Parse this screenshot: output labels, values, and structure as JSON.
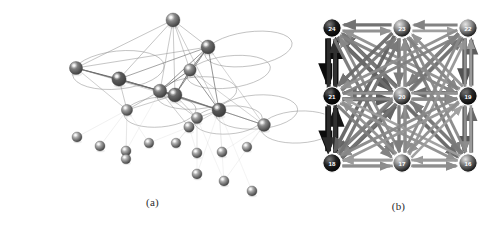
{
  "figure": {
    "panels": [
      {
        "id": "a",
        "caption": "(a)",
        "kind": "3d-force-directed-network",
        "description": "Three-dimensional layout of a network of shaded spheres joined by thin straight lines, with large thin elliptical rings (self-loops / community shells) drawn around several hub nodes."
      },
      {
        "id": "b",
        "caption": "(b)",
        "kind": "grid-directed-weighted-graph",
        "description": "Nine nodes arranged on a 3x3 grid, fully interconnected by weighted directed arrows of varying thickness and darkness."
      }
    ]
  },
  "chart_data": [
    {
      "type": "scatter",
      "id": "panel-a-network",
      "title": "(a)",
      "xlabel": "",
      "ylabel": "",
      "grid": false,
      "legend": "none",
      "xlim": [
        0,
        305
      ],
      "ylim": [
        0,
        200
      ],
      "nodes": [
        {
          "id": "n1",
          "x": 173,
          "y": 20,
          "r": 7.0,
          "shade": "#8a8a8a",
          "ring": false
        },
        {
          "id": "n2",
          "x": 208,
          "y": 47,
          "r": 7.0,
          "shade": "#6f6f6f",
          "ring": true,
          "rx": 44,
          "ry": 17,
          "rot": -8
        },
        {
          "id": "n3",
          "x": 76,
          "y": 68,
          "r": 6.6,
          "shade": "#7d7d7d",
          "ring": true,
          "rx": 46,
          "ry": 19,
          "rot": -6
        },
        {
          "id": "n4",
          "x": 190,
          "y": 70,
          "r": 6.2,
          "shade": "#8e8e8e",
          "ring": true,
          "rx": 42,
          "ry": 16,
          "rot": -7
        },
        {
          "id": "n5",
          "x": 119,
          "y": 79,
          "r": 7.2,
          "shade": "#5e5e5e",
          "ring": false
        },
        {
          "id": "n6",
          "x": 160,
          "y": 91,
          "r": 6.8,
          "shade": "#7a7a7a",
          "ring": true,
          "rx": 40,
          "ry": 16,
          "rot": -5
        },
        {
          "id": "n7",
          "x": 175,
          "y": 95,
          "r": 7.0,
          "shade": "#6b6b6b",
          "ring": false
        },
        {
          "id": "n8",
          "x": 219,
          "y": 110,
          "r": 7.0,
          "shade": "#5a5a5a",
          "ring": true,
          "rx": 41,
          "ry": 17,
          "rot": -4
        },
        {
          "id": "n9",
          "x": 127,
          "y": 110,
          "r": 5.6,
          "shade": "#9a9a9a",
          "ring": true,
          "rx": 36,
          "ry": 15,
          "rot": -5
        },
        {
          "id": "n10",
          "x": 197,
          "y": 118,
          "r": 5.6,
          "shade": "#9a9a9a",
          "ring": true,
          "rx": 34,
          "ry": 14,
          "rot": -4
        },
        {
          "id": "n11",
          "x": 264,
          "y": 125,
          "r": 6.4,
          "shade": "#8a8a8a",
          "ring": true,
          "rx": 38,
          "ry": 16,
          "rot": -3
        },
        {
          "id": "n12",
          "x": 189,
          "y": 127,
          "r": 5.2,
          "shade": "#a2a2a2",
          "ring": false
        },
        {
          "id": "n13",
          "x": 77,
          "y": 137,
          "r": 5.0,
          "shade": "#a8a8a8",
          "ring": false
        },
        {
          "id": "n14",
          "x": 100,
          "y": 146,
          "r": 5.0,
          "shade": "#a5a5a5",
          "ring": false
        },
        {
          "id": "n15",
          "x": 126,
          "y": 151,
          "r": 5.0,
          "shade": "#a5a5a5",
          "ring": false
        },
        {
          "id": "n16",
          "x": 149,
          "y": 143,
          "r": 4.8,
          "shade": "#ababab",
          "ring": false
        },
        {
          "id": "n17",
          "x": 176,
          "y": 143,
          "r": 4.8,
          "shade": "#ababab",
          "ring": false
        },
        {
          "id": "n18",
          "x": 126,
          "y": 159,
          "r": 4.8,
          "shade": "#adadad",
          "ring": false
        },
        {
          "id": "n19",
          "x": 197,
          "y": 153,
          "r": 5.0,
          "shade": "#a5a5a5",
          "ring": false
        },
        {
          "id": "n20",
          "x": 222,
          "y": 152,
          "r": 5.0,
          "shade": "#a5a5a5",
          "ring": false
        },
        {
          "id": "n21",
          "x": 247,
          "y": 147,
          "r": 4.8,
          "shade": "#adadad",
          "ring": false
        },
        {
          "id": "n22",
          "x": 197,
          "y": 174,
          "r": 5.0,
          "shade": "#a5a5a5",
          "ring": false
        },
        {
          "id": "n23",
          "x": 224,
          "y": 181,
          "r": 5.0,
          "shade": "#a5a5a5",
          "ring": false
        },
        {
          "id": "n24",
          "x": 252,
          "y": 191,
          "r": 5.0,
          "shade": "#a5a5a5",
          "ring": false
        }
      ],
      "edges": [
        {
          "s": "n1",
          "t": "n3",
          "w": 0.55
        },
        {
          "s": "n1",
          "t": "n2",
          "w": 0.55
        },
        {
          "s": "n1",
          "t": "n5",
          "w": 0.55
        },
        {
          "s": "n1",
          "t": "n6",
          "w": 0.5
        },
        {
          "s": "n1",
          "t": "n7",
          "w": 0.5
        },
        {
          "s": "n1",
          "t": "n4",
          "w": 0.5
        },
        {
          "s": "n1",
          "t": "n8",
          "w": 0.45
        },
        {
          "s": "n2",
          "t": "n3",
          "w": 0.55
        },
        {
          "s": "n2",
          "t": "n5",
          "w": 0.6
        },
        {
          "s": "n2",
          "t": "n7",
          "w": 0.75
        },
        {
          "s": "n2",
          "t": "n6",
          "w": 0.7
        },
        {
          "s": "n2",
          "t": "n4",
          "w": 0.8
        },
        {
          "s": "n2",
          "t": "n8",
          "w": 0.7
        },
        {
          "s": "n2",
          "t": "n11",
          "w": 0.4
        },
        {
          "s": "n3",
          "t": "n5",
          "w": 0.8
        },
        {
          "s": "n3",
          "t": "n6",
          "w": 0.6
        },
        {
          "s": "n3",
          "t": "n7",
          "w": 0.6
        },
        {
          "s": "n3",
          "t": "n9",
          "w": 0.45
        },
        {
          "s": "n3",
          "t": "n8",
          "w": 0.4
        },
        {
          "s": "n4",
          "t": "n7",
          "w": 0.8
        },
        {
          "s": "n4",
          "t": "n6",
          "w": 0.75
        },
        {
          "s": "n4",
          "t": "n8",
          "w": 0.7
        },
        {
          "s": "n4",
          "t": "n11",
          "w": 0.4
        },
        {
          "s": "n5",
          "t": "n6",
          "w": 0.75
        },
        {
          "s": "n5",
          "t": "n7",
          "w": 0.75
        },
        {
          "s": "n5",
          "t": "n9",
          "w": 0.5
        },
        {
          "s": "n5",
          "t": "n8",
          "w": 0.5
        },
        {
          "s": "n6",
          "t": "n7",
          "w": 0.9
        },
        {
          "s": "n6",
          "t": "n8",
          "w": 0.7
        },
        {
          "s": "n6",
          "t": "n9",
          "w": 0.55
        },
        {
          "s": "n6",
          "t": "n10",
          "w": 0.5
        },
        {
          "s": "n6",
          "t": "n12",
          "w": 0.45
        },
        {
          "s": "n7",
          "t": "n8",
          "w": 0.8
        },
        {
          "s": "n7",
          "t": "n10",
          "w": 0.5
        },
        {
          "s": "n7",
          "t": "n9",
          "w": 0.5
        },
        {
          "s": "n7",
          "t": "n11",
          "w": 0.45
        },
        {
          "s": "n8",
          "t": "n11",
          "w": 0.6
        },
        {
          "s": "n8",
          "t": "n10",
          "w": 0.5
        },
        {
          "s": "n8",
          "t": "n12",
          "w": 0.4
        },
        {
          "s": "n9",
          "t": "n13",
          "w": 0.22
        },
        {
          "s": "n9",
          "t": "n14",
          "w": 0.22
        },
        {
          "s": "n9",
          "t": "n15",
          "w": 0.22
        },
        {
          "s": "n9",
          "t": "n16",
          "w": 0.2
        },
        {
          "s": "n9",
          "t": "n18",
          "w": 0.2
        },
        {
          "s": "n10",
          "t": "n17",
          "w": 0.2
        },
        {
          "s": "n10",
          "t": "n19",
          "w": 0.2
        },
        {
          "s": "n10",
          "t": "n22",
          "w": 0.18
        },
        {
          "s": "n12",
          "t": "n16",
          "w": 0.18
        },
        {
          "s": "n12",
          "t": "n17",
          "w": 0.18
        },
        {
          "s": "n12",
          "t": "n19",
          "w": 0.18
        },
        {
          "s": "n11",
          "t": "n20",
          "w": 0.18
        },
        {
          "s": "n11",
          "t": "n21",
          "w": 0.18
        },
        {
          "s": "n11",
          "t": "n23",
          "w": 0.16
        },
        {
          "s": "n8",
          "t": "n20",
          "w": 0.16
        },
        {
          "s": "n8",
          "t": "n22",
          "w": 0.16
        },
        {
          "s": "n8",
          "t": "n23",
          "w": 0.16
        },
        {
          "s": "n8",
          "t": "n24",
          "w": 0.14
        },
        {
          "s": "n10",
          "t": "n23",
          "w": 0.14
        },
        {
          "s": "n6",
          "t": "n15",
          "w": 0.16
        }
      ]
    },
    {
      "type": "heatmap",
      "id": "panel-b-grid-graph",
      "title": "(b)",
      "xlabel": "",
      "ylabel": "",
      "grid": false,
      "legend": "none",
      "node_ids": [
        24,
        23,
        22,
        21,
        20,
        19,
        18,
        17,
        16
      ],
      "node_layout": [
        {
          "id": 24,
          "col": 0,
          "row": 0,
          "x": 27,
          "y": 28,
          "fill": "#1b1b1b"
        },
        {
          "id": 23,
          "col": 1,
          "row": 0,
          "x": 97,
          "y": 28,
          "fill": "#7e7e7e"
        },
        {
          "id": 22,
          "col": 2,
          "row": 0,
          "x": 163,
          "y": 28,
          "fill": "#8a8a8a"
        },
        {
          "id": 21,
          "col": 0,
          "row": 1,
          "x": 27,
          "y": 96,
          "fill": "#111111"
        },
        {
          "id": 20,
          "col": 1,
          "row": 1,
          "x": 97,
          "y": 96,
          "fill": "#7a7a7a"
        },
        {
          "id": 19,
          "col": 2,
          "row": 1,
          "x": 163,
          "y": 96,
          "fill": "#2a2a2a"
        },
        {
          "id": 18,
          "col": 0,
          "row": 2,
          "x": 27,
          "y": 163,
          "fill": "#1f1f1f"
        },
        {
          "id": 17,
          "col": 1,
          "row": 2,
          "x": 97,
          "y": 163,
          "fill": "#7a7a7a"
        },
        {
          "id": 16,
          "col": 2,
          "row": 2,
          "x": 163,
          "y": 163,
          "fill": "#6f6f6f"
        }
      ],
      "edges": [
        {
          "s": 24,
          "t": 21,
          "w": 1.0,
          "shade": "#000000"
        },
        {
          "s": 21,
          "t": 24,
          "w": 0.92,
          "shade": "#000000"
        },
        {
          "s": 21,
          "t": 18,
          "w": 0.98,
          "shade": "#000000"
        },
        {
          "s": 18,
          "t": 21,
          "w": 0.88,
          "shade": "#0a0a0a"
        },
        {
          "s": 24,
          "t": 18,
          "w": 0.62,
          "shade": "#2e2e2e"
        },
        {
          "s": 18,
          "t": 24,
          "w": 0.58,
          "shade": "#333333"
        },
        {
          "s": 23,
          "t": 24,
          "w": 0.52,
          "shade": "#6b6b6b"
        },
        {
          "s": 24,
          "t": 23,
          "w": 0.42,
          "shade": "#8d8d8d"
        },
        {
          "s": 22,
          "t": 23,
          "w": 0.46,
          "shade": "#7c7c7c"
        },
        {
          "s": 23,
          "t": 22,
          "w": 0.38,
          "shade": "#9a9a9a"
        },
        {
          "s": 22,
          "t": 19,
          "w": 0.72,
          "shade": "#4a4a4a"
        },
        {
          "s": 19,
          "t": 22,
          "w": 0.66,
          "shade": "#555555"
        },
        {
          "s": 19,
          "t": 16,
          "w": 0.7,
          "shade": "#4d4d4d"
        },
        {
          "s": 16,
          "t": 19,
          "w": 0.6,
          "shade": "#5f5f5f"
        },
        {
          "s": 22,
          "t": 16,
          "w": 0.4,
          "shade": "#909090"
        },
        {
          "s": 16,
          "t": 22,
          "w": 0.36,
          "shade": "#9d9d9d"
        },
        {
          "s": 18,
          "t": 17,
          "w": 0.44,
          "shade": "#858585"
        },
        {
          "s": 17,
          "t": 18,
          "w": 0.4,
          "shade": "#8f8f8f"
        },
        {
          "s": 17,
          "t": 16,
          "w": 0.44,
          "shade": "#858585"
        },
        {
          "s": 16,
          "t": 17,
          "w": 0.38,
          "shade": "#959595"
        },
        {
          "s": 24,
          "t": 20,
          "w": 0.66,
          "shade": "#505050"
        },
        {
          "s": 20,
          "t": 24,
          "w": 0.56,
          "shade": "#636363"
        },
        {
          "s": 23,
          "t": 20,
          "w": 0.5,
          "shade": "#737373"
        },
        {
          "s": 20,
          "t": 23,
          "w": 0.46,
          "shade": "#7d7d7d"
        },
        {
          "s": 22,
          "t": 20,
          "w": 0.5,
          "shade": "#737373"
        },
        {
          "s": 20,
          "t": 22,
          "w": 0.44,
          "shade": "#828282"
        },
        {
          "s": 21,
          "t": 20,
          "w": 0.64,
          "shade": "#525252"
        },
        {
          "s": 20,
          "t": 21,
          "w": 0.56,
          "shade": "#636363"
        },
        {
          "s": 19,
          "t": 20,
          "w": 0.56,
          "shade": "#636363"
        },
        {
          "s": 20,
          "t": 19,
          "w": 0.5,
          "shade": "#737373"
        },
        {
          "s": 18,
          "t": 20,
          "w": 0.58,
          "shade": "#5e5e5e"
        },
        {
          "s": 20,
          "t": 18,
          "w": 0.52,
          "shade": "#6e6e6e"
        },
        {
          "s": 17,
          "t": 20,
          "w": 0.46,
          "shade": "#7d7d7d"
        },
        {
          "s": 20,
          "t": 17,
          "w": 0.42,
          "shade": "#898989"
        },
        {
          "s": 16,
          "t": 20,
          "w": 0.48,
          "shade": "#787878"
        },
        {
          "s": 20,
          "t": 16,
          "w": 0.42,
          "shade": "#898989"
        },
        {
          "s": 24,
          "t": 16,
          "w": 0.52,
          "shade": "#6b6b6b"
        },
        {
          "s": 16,
          "t": 24,
          "w": 0.46,
          "shade": "#7a7a7a"
        },
        {
          "s": 18,
          "t": 22,
          "w": 0.5,
          "shade": "#737373"
        },
        {
          "s": 22,
          "t": 18,
          "w": 0.44,
          "shade": "#828282"
        },
        {
          "s": 24,
          "t": 17,
          "w": 0.48,
          "shade": "#787878"
        },
        {
          "s": 17,
          "t": 24,
          "w": 0.42,
          "shade": "#898989"
        },
        {
          "s": 24,
          "t": 19,
          "w": 0.44,
          "shade": "#828282"
        },
        {
          "s": 19,
          "t": 24,
          "w": 0.4,
          "shade": "#8f8f8f"
        },
        {
          "s": 23,
          "t": 18,
          "w": 0.56,
          "shade": "#636363"
        },
        {
          "s": 18,
          "t": 23,
          "w": 0.5,
          "shade": "#737373"
        },
        {
          "s": 23,
          "t": 16,
          "w": 0.48,
          "shade": "#787878"
        },
        {
          "s": 16,
          "t": 23,
          "w": 0.42,
          "shade": "#898989"
        },
        {
          "s": 23,
          "t": 17,
          "w": 0.46,
          "shade": "#7d7d7d"
        },
        {
          "s": 17,
          "t": 23,
          "w": 0.4,
          "shade": "#8f8f8f"
        },
        {
          "s": 23,
          "t": 19,
          "w": 0.44,
          "shade": "#828282"
        },
        {
          "s": 19,
          "t": 23,
          "w": 0.4,
          "shade": "#8f8f8f"
        },
        {
          "s": 23,
          "t": 21,
          "w": 0.52,
          "shade": "#6b6b6b"
        },
        {
          "s": 21,
          "t": 23,
          "w": 0.46,
          "shade": "#7a7a7a"
        },
        {
          "s": 21,
          "t": 17,
          "w": 0.46,
          "shade": "#7d7d7d"
        },
        {
          "s": 17,
          "t": 21,
          "w": 0.4,
          "shade": "#8f8f8f"
        },
        {
          "s": 21,
          "t": 19,
          "w": 0.42,
          "shade": "#898989"
        },
        {
          "s": 19,
          "t": 21,
          "w": 0.38,
          "shade": "#959595"
        },
        {
          "s": 21,
          "t": 16,
          "w": 0.4,
          "shade": "#8f8f8f"
        },
        {
          "s": 16,
          "t": 21,
          "w": 0.36,
          "shade": "#9d9d9d"
        },
        {
          "s": 21,
          "t": 22,
          "w": 0.44,
          "shade": "#828282"
        },
        {
          "s": 22,
          "t": 21,
          "w": 0.4,
          "shade": "#8f8f8f"
        },
        {
          "s": 22,
          "t": 17,
          "w": 0.42,
          "shade": "#898989"
        },
        {
          "s": 17,
          "t": 22,
          "w": 0.38,
          "shade": "#959595"
        },
        {
          "s": 19,
          "t": 18,
          "w": 0.42,
          "shade": "#898989"
        },
        {
          "s": 18,
          "t": 19,
          "w": 0.38,
          "shade": "#959595"
        },
        {
          "s": 19,
          "t": 17,
          "w": 0.4,
          "shade": "#8f8f8f"
        },
        {
          "s": 17,
          "t": 19,
          "w": 0.36,
          "shade": "#9d9d9d"
        },
        {
          "s": 18,
          "t": 16,
          "w": 0.4,
          "shade": "#8f8f8f"
        },
        {
          "s": 16,
          "t": 18,
          "w": 0.36,
          "shade": "#9d9d9d"
        }
      ]
    }
  ],
  "colors": {
    "background": "#ffffff",
    "node_dark": "#111111",
    "node_mid": "#7a7a7a",
    "node_light": "#a8a8a8",
    "edge_dark": "#000000",
    "edge_light": "#9d9d9d",
    "caption_text": "#2b2b2b"
  }
}
